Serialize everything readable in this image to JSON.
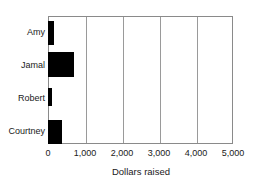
{
  "chart_data": {
    "type": "bar",
    "orientation": "horizontal",
    "title": "",
    "subtitle": "",
    "xlabel": "Dollars raised",
    "ylabel": "",
    "categories": [
      "Amy",
      "Jamal",
      "Robert",
      "Courtney"
    ],
    "values": [
      150,
      700,
      120,
      380
    ],
    "series": [
      {
        "name": "Dollars raised",
        "values": [
          150,
          700,
          120,
          380
        ]
      }
    ],
    "xlim": [
      0,
      5000
    ],
    "xticks": [
      0,
      1000,
      2000,
      3000,
      4000,
      5000
    ],
    "xtick_labels": [
      "0",
      "1,000",
      "2,000",
      "3,000",
      "4,000",
      "5,000"
    ],
    "grid": true,
    "grid_axis": "x",
    "legend": false,
    "legend_position": "none",
    "bar_color": "#000000",
    "grid_color": "#9a9a9a",
    "frame_color": "#8a8a8a",
    "background_color": "#ffffff",
    "text_color": "#1a1a1a"
  }
}
